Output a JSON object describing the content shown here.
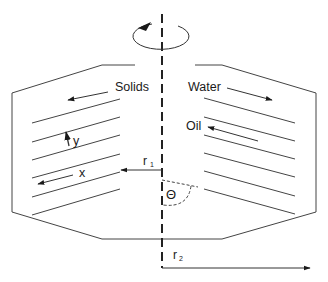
{
  "diagram": {
    "type": "inclined plate separator / disc centrifuge cross-section",
    "labels": {
      "solids": "Solids",
      "water": "Water",
      "oil": "Oil",
      "y": "y",
      "x": "x",
      "r1": "r",
      "r1_sub": "1",
      "r2": "r",
      "r2_sub": "2",
      "theta": "Θ"
    },
    "colors": {
      "stroke": "#333333",
      "text": "#1a1a1a",
      "background": "#ffffff"
    }
  }
}
